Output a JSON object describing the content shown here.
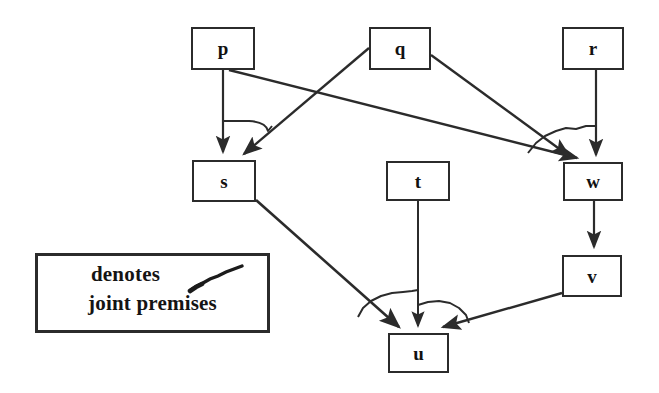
{
  "diagram": {
    "type": "argument-inference-diagram",
    "title": "",
    "background_color": "#ffffff",
    "stroke_color": "#2b2b2b",
    "text_color": "#111111",
    "nodes": [
      {
        "id": "p",
        "label": "p",
        "x": 191,
        "y": 27,
        "w": 64,
        "h": 43
      },
      {
        "id": "q",
        "label": "q",
        "x": 369,
        "y": 27,
        "w": 62,
        "h": 43
      },
      {
        "id": "r",
        "label": "r",
        "x": 562,
        "y": 27,
        "w": 62,
        "h": 43
      },
      {
        "id": "s",
        "label": "s",
        "x": 192,
        "y": 160,
        "w": 64,
        "h": 42
      },
      {
        "id": "t",
        "label": "t",
        "x": 386,
        "y": 161,
        "w": 64,
        "h": 40
      },
      {
        "id": "w",
        "label": "w",
        "x": 563,
        "y": 162,
        "w": 60,
        "h": 39
      },
      {
        "id": "v",
        "label": "v",
        "x": 562,
        "y": 255,
        "w": 60,
        "h": 42
      },
      {
        "id": "u",
        "label": "u",
        "x": 388,
        "y": 333,
        "w": 61,
        "h": 40
      }
    ],
    "edges": [
      {
        "from": "p",
        "to": "s",
        "style": "straight-arrow"
      },
      {
        "from": "q",
        "to": "s",
        "style": "straight-arrow"
      },
      {
        "from": "p",
        "to": "w",
        "style": "straight-arrow"
      },
      {
        "from": "q",
        "to": "w",
        "style": "straight-arrow"
      },
      {
        "from": "r",
        "to": "w",
        "style": "straight-arrow"
      },
      {
        "from": "w",
        "to": "v",
        "style": "straight-arrow"
      },
      {
        "from": "s",
        "to": "u",
        "style": "straight-arrow"
      },
      {
        "from": "t",
        "to": "u",
        "style": "straight-arrow"
      },
      {
        "from": "v",
        "to": "u",
        "style": "straight-arrow"
      }
    ],
    "joint_premise_arcs": [
      {
        "joins": [
          "p->s",
          "q->s"
        ],
        "near_node": "s"
      },
      {
        "joins": [
          "q->w",
          "r->w"
        ],
        "near_node": "w"
      },
      {
        "joins": [
          "s->u",
          "t->u"
        ],
        "near_node": "u"
      },
      {
        "joins": [
          "t->u",
          "v->u"
        ],
        "near_node": "u"
      }
    ]
  },
  "legend": {
    "line1": "denotes",
    "line2": "joint premises",
    "mark_icon": "joint-premise-slash-icon",
    "x": 35,
    "y": 253,
    "w": 235,
    "h": 80
  }
}
